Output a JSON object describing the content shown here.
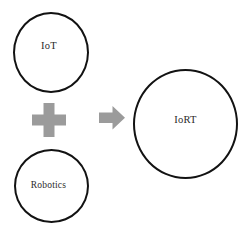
{
  "diagram": {
    "background_color": "#ffffff",
    "stroke_color": "#121212",
    "operator_color": "#9b9b9b",
    "text_color": "#2b2b2b",
    "nodes": [
      {
        "id": "iot",
        "label": "IoT",
        "role": "source",
        "shape": "circle"
      },
      {
        "id": "robotics",
        "label": "Robotics",
        "role": "source",
        "shape": "circle"
      },
      {
        "id": "iort",
        "label": "IoRT",
        "role": "result",
        "shape": "circle"
      }
    ],
    "operators": [
      {
        "id": "plus",
        "icon": "plus-icon",
        "meaning": "combine"
      },
      {
        "id": "arrow",
        "icon": "arrow-right-icon",
        "meaning": "yields"
      }
    ]
  }
}
